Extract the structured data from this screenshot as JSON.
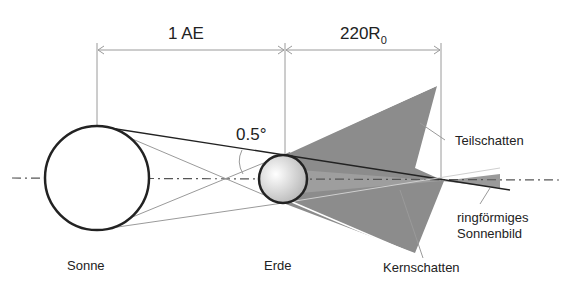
{
  "diagram": {
    "dimensions": {
      "sun_earth": "1 AE",
      "umbra_length_main": "220R",
      "umbra_length_sub": "0"
    },
    "angle_label": "0.5°",
    "labels": {
      "sun": "Sonne",
      "earth": "Erde",
      "penumbra": "Teilschatten",
      "umbra": "Kernschatten",
      "annular_line1": "ringförmiges",
      "annular_line2": "Sonnenbild"
    },
    "colors": {
      "shadow": "#8c8c8c",
      "lines": "#222222",
      "thin_lines": "#9a9a9a",
      "earth_fill_light": "#ffffff",
      "earth_fill_dark": "#b8b8b8"
    }
  }
}
